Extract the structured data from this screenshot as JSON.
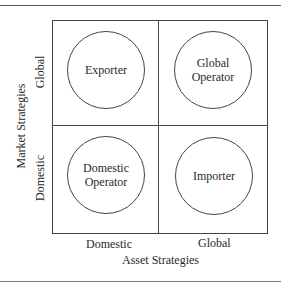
{
  "diagram": {
    "type": "2x2 matrix",
    "y_axis": {
      "title": "Market Strategies",
      "top_label": "Global",
      "bottom_label": "Domestic"
    },
    "x_axis": {
      "title": "Asset Strategies",
      "left_label": "Domestic",
      "right_label": "Global"
    },
    "cells": {
      "top_left": "Exporter",
      "top_right_line1": "Global",
      "top_right_line2": "Operator",
      "bottom_left_line1": "Domestic",
      "bottom_left_line2": "Operator",
      "bottom_right": "Importer"
    }
  }
}
